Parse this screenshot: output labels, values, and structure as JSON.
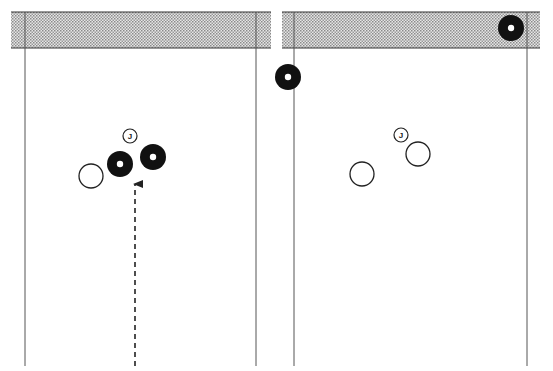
{
  "diagram": {
    "type": "bowls-rink-diagram",
    "colors": {
      "background": "#ffffff",
      "line": "#333333",
      "ditch_fill": "#c8c8c8",
      "stone_black": "#111111",
      "stone_white": "#ffffff"
    },
    "panels": [
      {
        "id": "before",
        "ditch": {
          "x": 11,
          "y": 12,
          "width": 260,
          "height": 36
        },
        "rink_lines": [
          25,
          256
        ],
        "jack": {
          "x": 130,
          "y": 136,
          "r": 7,
          "label": "J"
        },
        "bowls": [
          {
            "color": "white",
            "x": 91,
            "y": 176,
            "r": 12
          },
          {
            "color": "black",
            "x": 120,
            "y": 164,
            "r": 13
          },
          {
            "color": "black",
            "x": 153,
            "y": 157,
            "r": 13
          }
        ],
        "arrow": {
          "style": "dashed",
          "x": 135,
          "y_start": 365,
          "y_end": 183
        }
      },
      {
        "id": "after",
        "ditch": {
          "x": 282,
          "y": 12,
          "width": 258,
          "height": 36
        },
        "rink_lines": [
          294,
          527
        ],
        "jack": {
          "x": 401,
          "y": 135,
          "r": 7,
          "label": "J"
        },
        "bowls": [
          {
            "color": "black",
            "x": 511,
            "y": 28,
            "r": 13
          },
          {
            "color": "black",
            "x": 288,
            "y": 77,
            "r": 13
          },
          {
            "color": "white",
            "x": 418,
            "y": 154,
            "r": 12
          },
          {
            "color": "white",
            "x": 362,
            "y": 174,
            "r": 12
          }
        ]
      }
    ]
  }
}
